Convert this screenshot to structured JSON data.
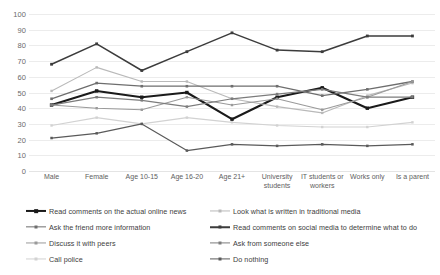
{
  "chart_data": {
    "type": "line",
    "title": "",
    "xlabel": "",
    "ylabel": "",
    "ylim": [
      0,
      100
    ],
    "ytick_step": 10,
    "grid": true,
    "legend_position": "bottom",
    "yticks": [
      "100",
      "90",
      "80",
      "70",
      "60",
      "50",
      "40",
      "30",
      "20",
      "10",
      "0"
    ],
    "categories": [
      "Male",
      "Female",
      "Age 10-15",
      "Age 16-20",
      "Age 21+",
      "University students",
      "IT students or workers",
      "Works only",
      "Is a parent"
    ],
    "series": [
      {
        "name": "Read comments on the actual online news",
        "color": "#1a1a1a",
        "width": 2.1,
        "values": [
          42,
          51,
          47,
          50,
          33,
          47,
          53,
          40,
          47
        ]
      },
      {
        "name": "Look what is written in traditional media",
        "color": "#b9b9b9",
        "width": 1.1,
        "values": [
          51,
          66,
          57,
          57,
          46,
          41,
          37,
          48,
          56
        ]
      },
      {
        "name": "Ask the friend more information",
        "color": "#6e6e6e",
        "width": 1.3,
        "values": [
          46,
          56,
          54,
          54,
          54,
          54,
          48,
          52,
          57
        ]
      },
      {
        "name": "Read comments on social media to determine what to do",
        "color": "#3c3c3c",
        "width": 1.5,
        "values": [
          68,
          81,
          64,
          76,
          88,
          77,
          76,
          86,
          86
        ]
      },
      {
        "name": "Discuss it with peers",
        "color": "#9a9a9a",
        "width": 1.1,
        "values": [
          42,
          40,
          39,
          47,
          42,
          46,
          39,
          47,
          57
        ]
      },
      {
        "name": "Ask from someone else",
        "color": "#7c7c7c",
        "width": 1.2,
        "values": [
          42,
          47,
          45,
          41,
          46,
          49,
          52,
          47,
          47
        ]
      },
      {
        "name": "Call police",
        "color": "#d2d2d2",
        "width": 1.1,
        "values": [
          29,
          34,
          30,
          34,
          31,
          29,
          28,
          28,
          31
        ]
      },
      {
        "name": "Do nothing",
        "color": "#5a5a5a",
        "width": 1.2,
        "values": [
          21,
          24,
          30,
          13,
          17,
          16,
          17,
          16,
          17
        ]
      }
    ],
    "legend_columns": [
      [
        "Read comments on the actual online news",
        "Ask the friend more information",
        "Discuss it with peers",
        "Call police"
      ],
      [
        "Look what is written in traditional media",
        "Read comments on social media to determine what to do",
        "Ask from someone else",
        "Do nothing"
      ]
    ]
  }
}
